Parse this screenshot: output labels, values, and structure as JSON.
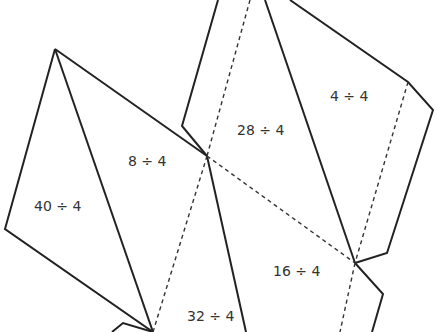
{
  "diagram": {
    "type": "net",
    "colors": {
      "line": "#222222",
      "text": "#333333",
      "background": "#ffffff"
    },
    "faces": [
      {
        "id": "face-40",
        "label": "40 ÷ 4",
        "x": 34,
        "y": 206
      },
      {
        "id": "face-8",
        "label": "8 ÷ 4",
        "x": 128,
        "y": 161
      },
      {
        "id": "face-28",
        "label": "28 ÷ 4",
        "x": 237,
        "y": 130
      },
      {
        "id": "face-4",
        "label": "4 ÷ 4",
        "x": 330,
        "y": 96
      },
      {
        "id": "face-16",
        "label": "16 ÷ 4",
        "x": 273,
        "y": 271
      },
      {
        "id": "face-32",
        "label": "32 ÷ 4",
        "x": 187,
        "y": 316
      }
    ],
    "solid_edges": [
      [
        [
          218,
          0
        ],
        [
          182,
          126
        ],
        [
          207,
          156
        ]
      ],
      [
        [
          265,
          0
        ],
        [
          355,
          263
        ]
      ],
      [
        [
          290,
          0
        ],
        [
          408,
          82
        ],
        [
          433,
          110
        ],
        [
          387,
          253
        ],
        [
          355,
          263
        ]
      ],
      [
        [
          355,
          263
        ],
        [
          383,
          294
        ],
        [
          372,
          332
        ]
      ],
      [
        [
          55,
          49
        ],
        [
          207,
          156
        ]
      ],
      [
        [
          55,
          49
        ],
        [
          5,
          229
        ],
        [
          153,
          332
        ]
      ],
      [
        [
          55,
          49
        ],
        [
          153,
          332
        ]
      ],
      [
        [
          207,
          156
        ],
        [
          246,
          332
        ]
      ],
      [
        [
          112,
          332
        ],
        [
          123,
          323
        ],
        [
          153,
          332
        ]
      ]
    ],
    "fold_lines": [
      [
        [
          250,
          0
        ],
        [
          207,
          156
        ]
      ],
      [
        [
          207,
          156
        ],
        [
          153,
          332
        ]
      ],
      [
        [
          207,
          156
        ],
        [
          355,
          263
        ]
      ],
      [
        [
          408,
          82
        ],
        [
          355,
          263
        ]
      ],
      [
        [
          355,
          263
        ],
        [
          340,
          332
        ]
      ]
    ]
  }
}
